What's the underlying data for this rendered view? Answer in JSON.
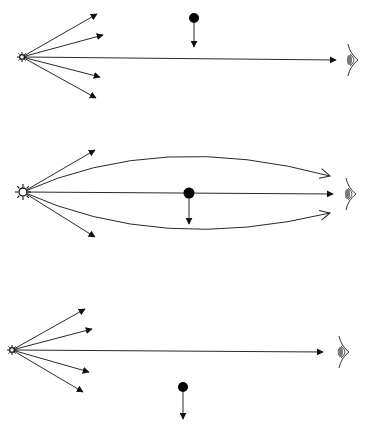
{
  "diagram": {
    "colors": {
      "line": "#2a2a2a",
      "mass": "#000000",
      "eye_iris": "#7a7a7a",
      "background": "#ffffff"
    },
    "panels": [
      {
        "id": "panel-1",
        "description": "Mass above the direct line of sight; straight rays",
        "star": {
          "icon": "star-sun-icon",
          "x": 22,
          "y": 57
        },
        "mass": {
          "icon": "mass-dot-icon",
          "x": 194,
          "y": 18,
          "arrow_to_y": 45
        },
        "observer": {
          "icon": "eye-icon",
          "x": 352,
          "y": 60
        },
        "rays": [
          {
            "type": "straight",
            "to": [
              97,
              14
            ]
          },
          {
            "type": "straight",
            "to": [
              103,
              35
            ]
          },
          {
            "type": "straight",
            "to": [
              336,
              60
            ]
          },
          {
            "type": "straight",
            "to": [
              100,
              77
            ]
          },
          {
            "type": "straight",
            "to": [
              96,
              98
            ]
          }
        ]
      },
      {
        "id": "panel-2",
        "description": "Mass on the line of sight; bent rays converge at observer",
        "star": {
          "icon": "star-sun-icon",
          "x": 23,
          "y": 192
        },
        "mass": {
          "icon": "mass-dot-icon",
          "x": 189,
          "y": 193,
          "arrow_to_y": 222
        },
        "observer": {
          "icon": "eye-icon",
          "x": 350,
          "y": 194
        },
        "rays": [
          {
            "type": "straight",
            "to": [
              95,
              150
            ]
          },
          {
            "type": "curved",
            "to": [
              330,
              176
            ]
          },
          {
            "type": "straight",
            "to": [
              333,
              194
            ]
          },
          {
            "type": "curved",
            "to": [
              330,
              213
            ]
          },
          {
            "type": "straight",
            "to": [
              95,
              237
            ]
          }
        ]
      },
      {
        "id": "panel-3",
        "description": "Mass below the line of sight; straight rays",
        "star": {
          "icon": "star-sun-icon",
          "x": 12,
          "y": 350
        },
        "mass": {
          "icon": "mass-dot-icon",
          "x": 183,
          "y": 387,
          "arrow_to_y": 417
        },
        "observer": {
          "icon": "eye-icon",
          "x": 343,
          "y": 352
        },
        "rays": [
          {
            "type": "straight",
            "to": [
              85,
              309
            ]
          },
          {
            "type": "straight",
            "to": [
              92,
              329
            ]
          },
          {
            "type": "straight",
            "to": [
              323,
              352
            ]
          },
          {
            "type": "straight",
            "to": [
              89,
              372
            ]
          },
          {
            "type": "straight",
            "to": [
              83,
              392
            ]
          }
        ]
      }
    ]
  }
}
